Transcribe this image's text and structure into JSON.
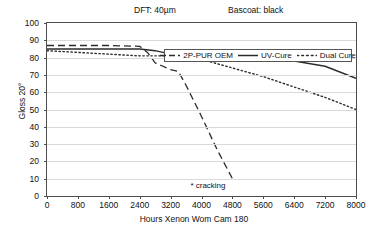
{
  "header": {
    "dft": "DFT: 40µm",
    "basecoat": "Bascoat: black"
  },
  "legend": {
    "items": [
      {
        "label": "2P-PUR OEM",
        "style": "dashed",
        "color": "#2b2b2b"
      },
      {
        "label": "UV-Cure",
        "style": "solid",
        "color": "#2b2b2b"
      },
      {
        "label": "Dual Cure",
        "style": "dotted",
        "color": "#2b2b2b"
      }
    ]
  },
  "annotations": {
    "cracking": "* cracking"
  },
  "chart_data": {
    "type": "line",
    "title": "DFT: 40µm    Bascoat: black",
    "xlabel": "Hours Xenon Wom Cam 180",
    "ylabel": "Gloss 20°",
    "xlim": [
      0,
      8000
    ],
    "ylim": [
      0,
      100
    ],
    "xticks": [
      0,
      800,
      1600,
      2400,
      3200,
      4000,
      4800,
      5600,
      6400,
      7200,
      8000
    ],
    "yticks": [
      0,
      10,
      20,
      30,
      40,
      50,
      60,
      70,
      80,
      90,
      100
    ],
    "grid": "horizontal",
    "legend_position": "top-center-inside",
    "series": [
      {
        "name": "2P-PUR OEM",
        "style": "dashed",
        "color": "#2b2b2b",
        "x": [
          0,
          400,
          800,
          1600,
          2400,
          2600,
          2800,
          3000,
          3200,
          3400,
          3600,
          4000,
          4400,
          4800
        ],
        "values": [
          87,
          87,
          87,
          87,
          86.5,
          83,
          77,
          75,
          73,
          72,
          64,
          46,
          27,
          10
        ]
      },
      {
        "name": "UV-Cure",
        "style": "solid",
        "color": "#2b2b2b",
        "x": [
          0,
          800,
          1600,
          2400,
          2800,
          3200,
          4000,
          4800,
          5600,
          6400,
          7200,
          8000
        ],
        "values": [
          85,
          85,
          85,
          85,
          84,
          82,
          81,
          80,
          79,
          78,
          75,
          68
        ]
      },
      {
        "name": "Dual Cure",
        "style": "dotted",
        "color": "#2b2b2b",
        "x": [
          0,
          800,
          1600,
          2400,
          3200,
          4000,
          4800,
          5600,
          6400,
          7200,
          8000
        ],
        "values": [
          84,
          83,
          82,
          81,
          81,
          79,
          74,
          69,
          63,
          57,
          50
        ]
      }
    ],
    "annotations": [
      {
        "text": "* cracking",
        "x": 4800,
        "y": 9,
        "series": "2P-PUR OEM"
      }
    ]
  }
}
